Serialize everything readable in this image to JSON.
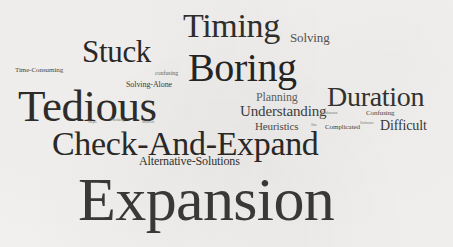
{
  "image": {
    "type": "word-cloud",
    "background_color": "#f4f3f1",
    "width": 453,
    "height": 247,
    "typeface_style": "serif",
    "orientation": "all-horizontal"
  },
  "words": [
    {
      "text": "Expansion",
      "size": 62,
      "x": 78,
      "y": 168,
      "color": "#3b3a38",
      "weight": 1.0
    },
    {
      "text": "Tedious",
      "size": 45,
      "x": 18,
      "y": 84,
      "color": "#2e2d2b",
      "weight": 0.73
    },
    {
      "text": "Check-And-Expand",
      "size": 34,
      "x": 52,
      "y": 127,
      "color": "#2b2a28",
      "weight": 0.55
    },
    {
      "text": "Boring",
      "size": 40,
      "x": 188,
      "y": 48,
      "color": "#262523",
      "weight": 0.65
    },
    {
      "text": "Timing",
      "size": 34,
      "x": 183,
      "y": 9,
      "color": "#302f2d",
      "weight": 0.55
    },
    {
      "text": "Stuck",
      "size": 31,
      "x": 82,
      "y": 36,
      "color": "#2a2927",
      "weight": 0.5
    },
    {
      "text": "Duration",
      "size": 28,
      "x": 327,
      "y": 83,
      "color": "#353432",
      "weight": 0.45
    },
    {
      "text": "Understanding",
      "size": 15,
      "x": 240,
      "y": 104,
      "color": "#403f3d",
      "weight": 0.24
    },
    {
      "text": "Difficult",
      "size": 14,
      "x": 380,
      "y": 119,
      "color": "#3a3937",
      "weight": 0.22
    },
    {
      "text": "Solving",
      "size": 13,
      "x": 290,
      "y": 31,
      "color": "#57544f",
      "weight": 0.21
    },
    {
      "text": "Planning",
      "size": 12,
      "x": 256,
      "y": 91,
      "color": "#66635d",
      "weight": 0.19
    },
    {
      "text": "Heuristics",
      "size": 11,
      "x": 255,
      "y": 121,
      "color": "#4e4c48",
      "weight": 0.18
    },
    {
      "text": "Alternative-Solutions",
      "size": 12,
      "x": 139,
      "y": 155,
      "color": "#34332f",
      "weight": 0.19
    },
    {
      "text": "Time-Consuming",
      "size": 7,
      "x": 15,
      "y": 67,
      "color": "#4a4844",
      "weight": 0.11
    },
    {
      "text": "Solving-Alone",
      "size": 8,
      "x": 126,
      "y": 81,
      "color": "#3e3d3a",
      "weight": 0.13
    },
    {
      "text": "confusing",
      "size": 6,
      "x": 155,
      "y": 70,
      "color": "#6c6962",
      "weight": 0.1
    },
    {
      "text": "Confusing",
      "size": 7,
      "x": 366,
      "y": 110,
      "color": "#4c4a46",
      "weight": 0.11
    },
    {
      "text": "Complicated",
      "size": 7,
      "x": 325,
      "y": 124,
      "color": "#45443f",
      "weight": 0.11
    },
    {
      "text": "Unknown",
      "size": 4,
      "x": 322,
      "y": 111,
      "color": "#7d7a73",
      "weight": 0.07
    },
    {
      "text": "Software",
      "size": 4,
      "x": 360,
      "y": 121,
      "color": "#807d76",
      "weight": 0.07
    },
    {
      "text": "Steps",
      "size": 4,
      "x": 88,
      "y": 120,
      "color": "#7a7770",
      "weight": 0.07
    },
    {
      "text": "Thinking",
      "size": 4,
      "x": 110,
      "y": 118,
      "color": "#7a7770",
      "weight": 0.07
    },
    {
      "text": "Indirect",
      "size": 4,
      "x": 142,
      "y": 120,
      "color": "#7a7770",
      "weight": 0.07
    },
    {
      "text": "Site",
      "size": 4,
      "x": 311,
      "y": 123,
      "color": "#817e77",
      "weight": 0.07
    }
  ]
}
